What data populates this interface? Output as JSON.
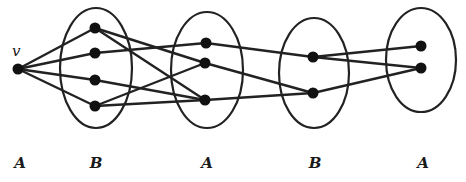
{
  "diagram": {
    "type": "layered-graph",
    "colors": {
      "stroke": "#222222",
      "node": "#111111",
      "background": "#ffffff"
    },
    "vertex_label": "v",
    "groups": [
      {
        "id": "A0",
        "label": "A",
        "cx": 20,
        "cy": 68,
        "rx": 0,
        "ry": 0
      },
      {
        "id": "B1",
        "label": "B",
        "cx": 96,
        "cy": 68,
        "rx": 36,
        "ry": 60
      },
      {
        "id": "A2",
        "label": "A",
        "cx": 207,
        "cy": 70,
        "rx": 36,
        "ry": 58
      },
      {
        "id": "B3",
        "label": "B",
        "cx": 314,
        "cy": 73,
        "rx": 35,
        "ry": 55
      },
      {
        "id": "A4",
        "label": "A",
        "cx": 421,
        "cy": 60,
        "rx": 35,
        "ry": 52
      }
    ],
    "nodes": [
      {
        "id": "v",
        "x": 18,
        "y": 69
      },
      {
        "id": "b1",
        "x": 95,
        "y": 28
      },
      {
        "id": "b2",
        "x": 95,
        "y": 53
      },
      {
        "id": "b3",
        "x": 95,
        "y": 80
      },
      {
        "id": "b4",
        "x": 95,
        "y": 106
      },
      {
        "id": "a1",
        "x": 206,
        "y": 43
      },
      {
        "id": "a2",
        "x": 205,
        "y": 63
      },
      {
        "id": "a3",
        "x": 205,
        "y": 100
      },
      {
        "id": "c1",
        "x": 313,
        "y": 57
      },
      {
        "id": "c2",
        "x": 313,
        "y": 93
      },
      {
        "id": "d1",
        "x": 421,
        "y": 46
      },
      {
        "id": "d2",
        "x": 421,
        "y": 68
      }
    ],
    "edges": [
      [
        "v",
        "b1"
      ],
      [
        "v",
        "b2"
      ],
      [
        "v",
        "b3"
      ],
      [
        "v",
        "b4"
      ],
      [
        "b1",
        "a2"
      ],
      [
        "b1",
        "a3"
      ],
      [
        "b2",
        "a1"
      ],
      [
        "b3",
        "a3"
      ],
      [
        "b4",
        "a2"
      ],
      [
        "b4",
        "a3"
      ],
      [
        "a1",
        "c1"
      ],
      [
        "a2",
        "c2"
      ],
      [
        "a3",
        "c2"
      ],
      [
        "c1",
        "d1"
      ],
      [
        "c1",
        "d2"
      ],
      [
        "c2",
        "d2"
      ]
    ],
    "bottom_labels": [
      {
        "text": "A",
        "x": 20
      },
      {
        "text": "B",
        "x": 96
      },
      {
        "text": "A",
        "x": 207
      },
      {
        "text": "B",
        "x": 315
      },
      {
        "text": "A",
        "x": 423
      }
    ]
  }
}
